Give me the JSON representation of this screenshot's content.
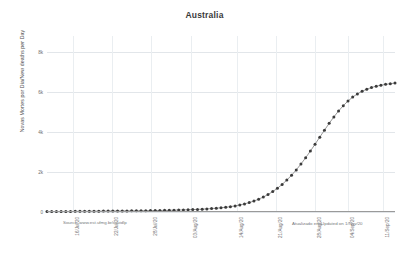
{
  "chart_data": {
    "type": "line",
    "title": "Australia",
    "xlabel": "",
    "ylabel": "Novas Mortes por Dia/New deaths per Day",
    "ylim": [
      0,
      8800
    ],
    "y_ticks": [
      0,
      2000,
      4000,
      6000,
      8000
    ],
    "y_tick_labels": [
      "0",
      "2k",
      "4k",
      "6k",
      "8k"
    ],
    "grid": true,
    "legend": null,
    "marker": "circle",
    "line_color": "#888888",
    "marker_color": "#3b3b3b",
    "x_tick_labels": [
      "16/Jul/20",
      "22/Jul/20",
      "28/Jul/20",
      "03/Aug/20",
      "14/Aug/20",
      "21/Aug/20",
      "28/Aug/20",
      "04/Sep/20",
      "11/Sep/20"
    ],
    "x_tick_positions": [
      0.075,
      0.188,
      0.3,
      0.413,
      0.545,
      0.658,
      0.77,
      0.865,
      0.965
    ],
    "series": [
      {
        "name": "New deaths per Day",
        "values": [
          20,
          22,
          24,
          26,
          28,
          30,
          32,
          34,
          36,
          38,
          40,
          42,
          44,
          46,
          48,
          50,
          52,
          55,
          58,
          60,
          63,
          66,
          70,
          74,
          78,
          82,
          86,
          92,
          98,
          105,
          112,
          120,
          130,
          142,
          156,
          172,
          190,
          212,
          238,
          268,
          305,
          350,
          405,
          470,
          548,
          640,
          748,
          874,
          1020,
          1188,
          1380,
          1596,
          1838,
          2106,
          2398,
          2712,
          3044,
          3390,
          3742,
          4092,
          4432,
          4754,
          5050,
          5316,
          5548,
          5744,
          5906,
          6036,
          6140,
          6222,
          6288,
          6340,
          6382,
          6416,
          6444
        ]
      }
    ],
    "annotations": {
      "source": "Source: www.est.ufmg.br/covidlp",
      "updated": "Atualizado em/Updated on 1/Nov/20"
    }
  },
  "footer": {
    "source": "Source: www.est.ufmg.br/covidlp",
    "updated": "Atualizado em/Updated on 1/Nov/20"
  }
}
